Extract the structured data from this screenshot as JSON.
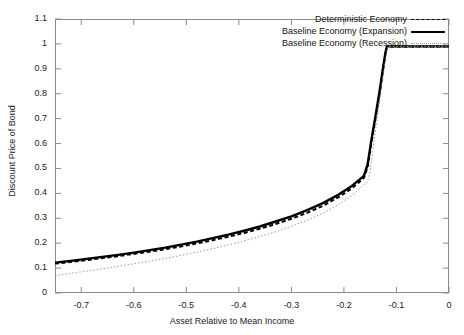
{
  "chart_data": {
    "type": "line",
    "title": "",
    "xlabel": "Asset Relative to Mean Income",
    "ylabel": "Discount Price of Bond",
    "xlim": [
      -0.75,
      0
    ],
    "ylim": [
      0,
      1.1
    ],
    "grid": false,
    "legend_position": "top-right-inside",
    "xticks": [
      -0.7,
      -0.6,
      -0.5,
      -0.4,
      -0.3,
      -0.2,
      -0.1,
      0
    ],
    "xtick_labels": [
      "-0.7",
      "-0.6",
      "-0.5",
      "-0.4",
      "-0.3",
      "-0.2",
      "-0.1",
      "0"
    ],
    "yticks": [
      0,
      0.1,
      0.2,
      0.3,
      0.4,
      0.5,
      0.6,
      0.7,
      0.8,
      0.9,
      1,
      1.1
    ],
    "ytick_labels": [
      "0",
      "0.1",
      "0.2",
      "0.3",
      "0.4",
      "0.5",
      "0.6",
      "0.7",
      "0.8",
      "0.9",
      "1",
      "1.1"
    ],
    "series": [
      {
        "name": "Deterministic Economy",
        "style": "dashed",
        "color": "#000000",
        "width": 2.0,
        "x": [
          -0.75,
          -0.72,
          -0.69,
          -0.66,
          -0.63,
          -0.6,
          -0.57,
          -0.54,
          -0.51,
          -0.48,
          -0.45,
          -0.42,
          -0.39,
          -0.36,
          -0.33,
          -0.3,
          -0.27,
          -0.24,
          -0.21,
          -0.185,
          -0.17,
          -0.162,
          -0.155,
          -0.148,
          -0.14,
          -0.132,
          -0.126,
          -0.121,
          -0.118,
          -0.1,
          -0.05,
          0.0
        ],
        "y": [
          0.118,
          0.125,
          0.132,
          0.14,
          0.148,
          0.157,
          0.166,
          0.176,
          0.187,
          0.199,
          0.212,
          0.226,
          0.241,
          0.258,
          0.277,
          0.298,
          0.322,
          0.35,
          0.385,
          0.42,
          0.447,
          0.462,
          0.505,
          0.6,
          0.7,
          0.8,
          0.89,
          0.96,
          0.99,
          0.99,
          0.99,
          0.99
        ]
      },
      {
        "name": "Baseline Economy (Expansion)",
        "style": "solid",
        "color": "#000000",
        "width": 2.4,
        "x": [
          -0.75,
          -0.72,
          -0.69,
          -0.66,
          -0.63,
          -0.6,
          -0.57,
          -0.54,
          -0.51,
          -0.48,
          -0.45,
          -0.42,
          -0.39,
          -0.36,
          -0.33,
          -0.3,
          -0.27,
          -0.24,
          -0.21,
          -0.185,
          -0.17,
          -0.162,
          -0.155,
          -0.148,
          -0.14,
          -0.132,
          -0.126,
          -0.121,
          -0.118,
          -0.1,
          -0.05,
          0.0
        ],
        "y": [
          0.122,
          0.129,
          0.137,
          0.145,
          0.153,
          0.162,
          0.172,
          0.182,
          0.194,
          0.206,
          0.22,
          0.234,
          0.25,
          0.267,
          0.287,
          0.308,
          0.333,
          0.361,
          0.395,
          0.43,
          0.456,
          0.47,
          0.515,
          0.61,
          0.71,
          0.812,
          0.898,
          0.965,
          0.99,
          0.99,
          0.99,
          0.99
        ]
      },
      {
        "name": "Baseline Economy (Recession)",
        "style": "dotted",
        "color": "#9a9a9a",
        "width": 1.0,
        "x": [
          -0.75,
          -0.72,
          -0.69,
          -0.66,
          -0.63,
          -0.6,
          -0.57,
          -0.54,
          -0.51,
          -0.48,
          -0.45,
          -0.42,
          -0.39,
          -0.36,
          -0.33,
          -0.3,
          -0.27,
          -0.24,
          -0.21,
          -0.185,
          -0.165,
          -0.155,
          -0.15,
          -0.144,
          -0.137,
          -0.13,
          -0.124,
          -0.119,
          -0.116,
          -0.1,
          -0.05,
          0.0
        ],
        "y": [
          0.07,
          0.079,
          0.088,
          0.097,
          0.107,
          0.117,
          0.128,
          0.139,
          0.151,
          0.164,
          0.178,
          0.193,
          0.209,
          0.227,
          0.246,
          0.268,
          0.292,
          0.32,
          0.355,
          0.392,
          0.428,
          0.448,
          0.49,
          0.59,
          0.695,
          0.8,
          0.89,
          0.962,
          0.99,
          0.99,
          0.99,
          0.99
        ]
      }
    ]
  },
  "legend": {
    "items": [
      {
        "label": "Deterministic Economy",
        "sample": "dashed-line-sample"
      },
      {
        "label": "Baseline Economy (Expansion)",
        "sample": "solid-line-sample"
      },
      {
        "label": "Baseline Economy (Recession)",
        "sample": "dotted-line-sample"
      }
    ]
  }
}
